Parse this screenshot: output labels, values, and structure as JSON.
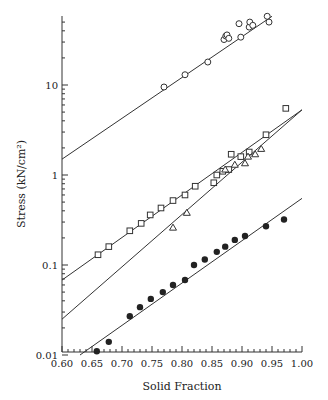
{
  "chart_data": {
    "type": "scatter",
    "title": "",
    "xlabel": "Solid Fraction",
    "ylabel": "Stress (kN/cm²)",
    "xlim": [
      0.6,
      1.0
    ],
    "ylim": [
      0.01,
      58
    ],
    "yscale": "log",
    "xticks": [
      "0.60",
      "0.65",
      "0.70",
      "0.75",
      "0.80",
      "0.85",
      "0.90",
      "0.95",
      "1.00"
    ],
    "yticks": [
      "0.01",
      "0.1",
      "1",
      "10"
    ],
    "series": [
      {
        "name": "circles",
        "marker": "open-circle",
        "x": [
          0.77,
          0.805,
          0.843,
          0.87,
          0.873,
          0.875,
          0.878,
          0.895,
          0.898,
          0.912,
          0.913,
          0.918,
          0.942,
          0.945
        ],
        "y": [
          9.5,
          13,
          18,
          32,
          35,
          36,
          33,
          48,
          34,
          44,
          50,
          46,
          58,
          50
        ],
        "fit": [
          [
            0.6,
            1.5
          ],
          [
            0.95,
            58
          ]
        ]
      },
      {
        "name": "squares",
        "marker": "open-square",
        "x": [
          0.66,
          0.678,
          0.713,
          0.732,
          0.747,
          0.765,
          0.785,
          0.805,
          0.822,
          0.853,
          0.858,
          0.868,
          0.878,
          0.882,
          0.898,
          0.912,
          0.94,
          0.973
        ],
        "y": [
          0.13,
          0.16,
          0.24,
          0.29,
          0.36,
          0.43,
          0.52,
          0.6,
          0.75,
          0.82,
          1.0,
          1.1,
          1.15,
          1.7,
          1.6,
          1.8,
          2.8,
          5.5
        ],
        "fit": [
          [
            0.6,
            0.068
          ],
          [
            1.0,
            5.3
          ]
        ]
      },
      {
        "name": "triangles",
        "marker": "open-triangle",
        "x": [
          0.785,
          0.808,
          0.872,
          0.888,
          0.905,
          0.91,
          0.922,
          0.932
        ],
        "y": [
          0.26,
          0.38,
          1.15,
          1.3,
          1.35,
          1.6,
          1.7,
          1.95
        ],
        "fit": [
          [
            0.6,
            0.025
          ],
          [
            1.0,
            5.3
          ]
        ]
      },
      {
        "name": "filled-circles",
        "marker": "filled-circle",
        "x": [
          0.658,
          0.678,
          0.713,
          0.73,
          0.748,
          0.768,
          0.785,
          0.805,
          0.82,
          0.838,
          0.858,
          0.872,
          0.888,
          0.905,
          0.94,
          0.97
        ],
        "y": [
          0.011,
          0.014,
          0.027,
          0.034,
          0.042,
          0.05,
          0.06,
          0.068,
          0.1,
          0.115,
          0.14,
          0.16,
          0.19,
          0.21,
          0.27,
          0.32
        ],
        "fit": [
          [
            0.63,
            0.01
          ],
          [
            1.0,
            0.55
          ]
        ]
      }
    ]
  }
}
